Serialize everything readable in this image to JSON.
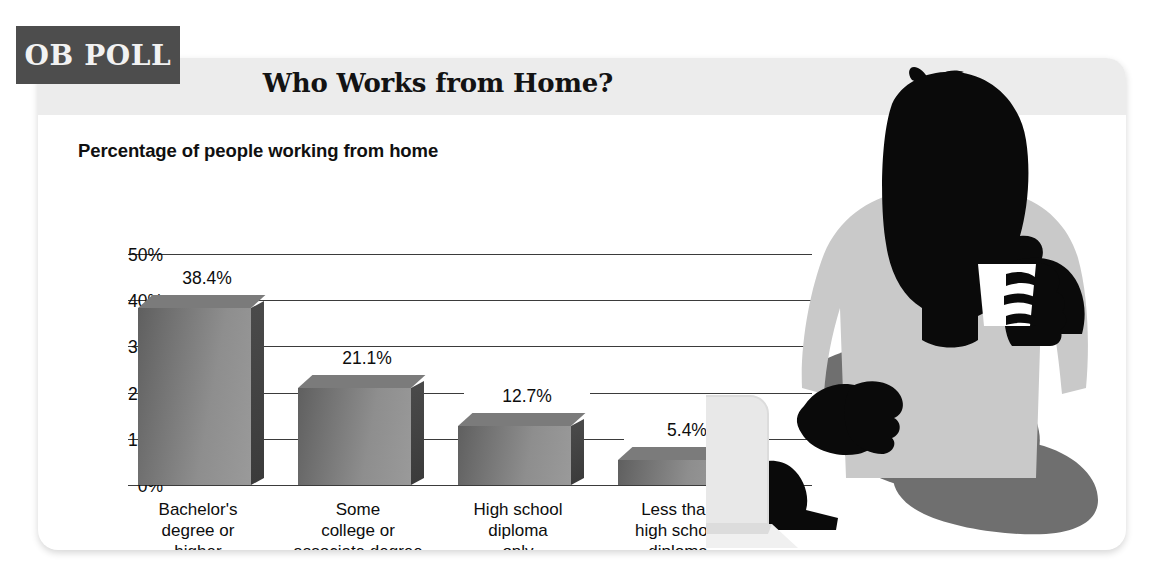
{
  "badge": {
    "label": "OB POLL"
  },
  "card": {
    "title": "Who Works from Home?",
    "subtitle": "Percentage of people working from home"
  },
  "chart_data": {
    "type": "bar",
    "title": "Who Works from Home?",
    "subtitle": "Percentage of people working from home",
    "xlabel": "",
    "ylabel": "",
    "ylim": [
      0,
      50
    ],
    "grid": true,
    "legend": false,
    "unit": "%",
    "categories": [
      "Bachelor's\ndegree or\nhigher",
      "Some\ncollege or\nassociate degree",
      "High school\ndiploma\nonly",
      "Less than\nhigh school\ndiploma"
    ],
    "values": [
      38.4,
      21.1,
      12.7,
      5.4
    ],
    "value_labels": [
      "38.4%",
      "21.1%",
      "12.7%",
      "5.4%"
    ],
    "ytick_labels": [
      "50%",
      "40%",
      "30%",
      "20%",
      "10%",
      "0%"
    ],
    "ytick_values": [
      50,
      40,
      30,
      20,
      10,
      0
    ]
  },
  "colors": {
    "badge_bg": "#4d4d4d",
    "badge_text": "#f2f2f2",
    "header_band": "#ececec",
    "bar_light": "#9a9a9a",
    "bar_dark": "#5f5f5f",
    "bar_side": "#3f3f3f",
    "gridline": "#3b3b3b",
    "text": "#0d0d0d",
    "silhouette": "#0a0a0a",
    "shirt": "#c9c9c9",
    "legs": "#6f6f6f",
    "laptop": "#e4e4e4"
  },
  "illustration": {
    "person_label": "person-silhouette-with-cup",
    "laptop_label": "laptop"
  }
}
